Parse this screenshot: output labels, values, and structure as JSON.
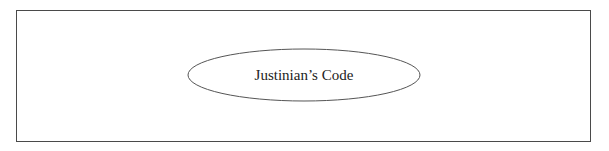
{
  "diagram": {
    "node": {
      "label": "Justinian’s Code",
      "shape": "ellipse",
      "stroke_color": "#555555",
      "fill_color": "#ffffff"
    },
    "frame": {
      "stroke_color": "#4a4a4a"
    }
  }
}
